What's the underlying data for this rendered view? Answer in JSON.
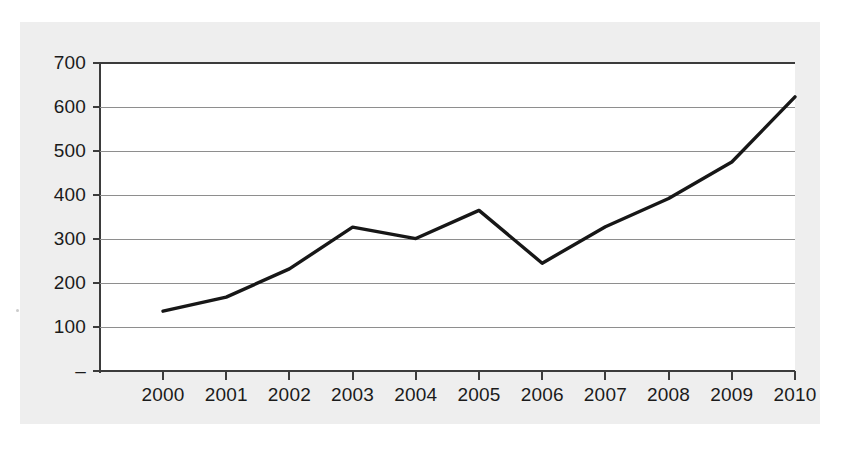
{
  "chart_data": {
    "type": "line",
    "title": "",
    "subtitle": "",
    "xlabel": "",
    "ylabel": "",
    "categories": [
      "2000",
      "2001",
      "2002",
      "2003",
      "2004",
      "2005",
      "2006",
      "2007",
      "2008",
      "2009",
      "2010"
    ],
    "values": [
      136,
      168,
      232,
      327,
      301,
      365,
      245,
      328,
      392,
      475,
      623
    ],
    "series": [
      {
        "name": "",
        "values": [
          136,
          168,
          232,
          327,
          301,
          365,
          245,
          328,
          392,
          475,
          623
        ]
      }
    ],
    "ylim": [
      0,
      700
    ],
    "ytick_values": [
      0,
      100,
      200,
      300,
      400,
      500,
      600,
      700
    ],
    "ytick_labels": [
      "–",
      "100",
      "200",
      "300",
      "400",
      "500",
      "600",
      "700"
    ],
    "xtick_labels": [
      "2000",
      "2001",
      "2002",
      "2003",
      "2004",
      "2005",
      "2006",
      "2007",
      "2008",
      "2009",
      "2010"
    ],
    "grid": "horizontal",
    "legend": "none",
    "line_color": "#171717",
    "grid_color": "#8e8e8e",
    "axis_color": "#3b3b3b",
    "plot_background": "#ffffff",
    "panel_background": "#eeeeee",
    "page_background": "#ffffff",
    "annotations": []
  }
}
